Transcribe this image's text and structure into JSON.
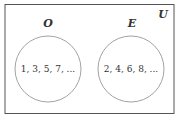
{
  "diagram": {
    "type": "venn",
    "universe": {
      "label": "U"
    },
    "sets": [
      {
        "label": "O",
        "elements": "1, 3, 5, 7, ..."
      },
      {
        "label": "E",
        "elements": "2, 4, 6, 8, ..."
      }
    ],
    "colors": {
      "stroke": "#555555",
      "circle_stroke": "#888888",
      "text": "#333333"
    }
  }
}
